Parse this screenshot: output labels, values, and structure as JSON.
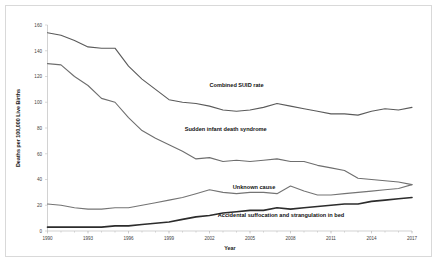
{
  "chart_data": {
    "type": "line",
    "title": "",
    "xlabel": "Year",
    "ylabel": "Deaths per 100,000 Live Births",
    "xlim": [
      1990,
      2017
    ],
    "ylim": [
      0,
      160
    ],
    "xticks": [
      "1990",
      "1993",
      "1996",
      "1999",
      "2002",
      "2005",
      "2008",
      "2011",
      "2014",
      "2017"
    ],
    "yticks": [
      "0",
      "20",
      "40",
      "60",
      "80",
      "100",
      "120",
      "140",
      "160"
    ],
    "grid": false,
    "legend_position": "inline-annotations",
    "x": [
      1990,
      1991,
      1992,
      1993,
      1994,
      1995,
      1996,
      1997,
      1998,
      1999,
      2000,
      2001,
      2002,
      2003,
      2004,
      2005,
      2006,
      2007,
      2008,
      2009,
      2010,
      2011,
      2012,
      2013,
      2014,
      2015,
      2016,
      2017
    ],
    "series": [
      {
        "name": "Combined SUID rate",
        "color": "#5a5a5a",
        "width": 1.1,
        "label_x": 2004.0,
        "label_y": 112,
        "values": [
          154,
          152,
          148,
          143,
          142,
          142,
          128,
          118,
          110,
          102,
          100,
          99,
          97,
          94,
          93,
          94,
          96,
          99,
          97,
          95,
          93,
          91,
          91,
          90,
          93,
          95,
          94,
          96
        ]
      },
      {
        "name": "Sudden infant death syndrome",
        "color": "#6e6e6e",
        "width": 1.1,
        "label_x": 2003.2,
        "label_y": 78,
        "values": [
          130,
          129,
          120,
          113,
          103,
          100,
          88,
          78,
          72,
          67,
          62,
          56,
          57,
          54,
          55,
          54,
          55,
          56,
          54,
          54,
          51,
          49,
          47,
          41,
          40,
          39,
          38,
          36
        ]
      },
      {
        "name": "Unknown cause",
        "color": "#747474",
        "width": 1.1,
        "label_x": 2005.3,
        "label_y": 33,
        "values": [
          21,
          20,
          18,
          17,
          17,
          18,
          18,
          20,
          22,
          24,
          26,
          29,
          32,
          30,
          29,
          30,
          30,
          29,
          35,
          31,
          28,
          28,
          29,
          30,
          31,
          32,
          33,
          36
        ]
      },
      {
        "name": "Accidental suffocation and strangulation in bed",
        "color": "#2c2c2c",
        "width": 1.6,
        "label_x": 2007.3,
        "label_y": 11,
        "values": [
          3,
          3,
          3,
          3,
          3,
          4,
          4,
          5,
          6,
          7,
          9,
          11,
          12,
          14,
          15,
          16,
          16,
          18,
          17,
          18,
          19,
          20,
          21,
          21,
          23,
          24,
          25,
          26
        ]
      }
    ]
  }
}
